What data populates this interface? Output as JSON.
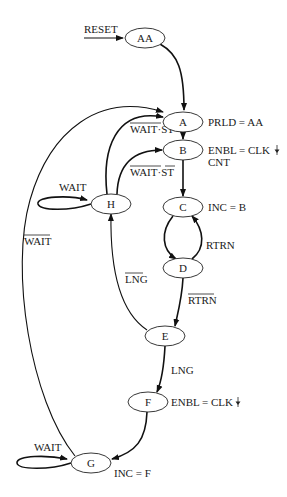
{
  "diagram": {
    "type": "state-machine",
    "states": {
      "AA": {
        "label": "AA"
      },
      "A": {
        "label": "A",
        "output": "PRLD = AA"
      },
      "B": {
        "label": "B",
        "output_line1": "ENBL = CLK",
        "output_line2": "CNT"
      },
      "C": {
        "label": "C",
        "output": "INC = B"
      },
      "D": {
        "label": "D"
      },
      "E": {
        "label": "E"
      },
      "F": {
        "label": "F",
        "output": "ENBL = CLK"
      },
      "G": {
        "label": "G",
        "output": "INC = F"
      },
      "H": {
        "label": "H"
      }
    },
    "edge_labels": {
      "reset": "RESET",
      "h_to_a": "WAIT·ST",
      "h_to_b": "WAIT·ST",
      "h_self": "WAIT",
      "g_to_a": "WAIT",
      "c_d_loop": "RTRN",
      "d_to_e": "RTRN",
      "e_to_h": "LNG",
      "e_to_f": "LNG",
      "g_self": "WAIT"
    },
    "transitions": [
      {
        "from": "RESET",
        "to": "AA",
        "condition": "RESET"
      },
      {
        "from": "AA",
        "to": "A",
        "condition": ""
      },
      {
        "from": "A",
        "to": "B",
        "condition": ""
      },
      {
        "from": "B",
        "to": "C",
        "condition": ""
      },
      {
        "from": "C",
        "to": "D",
        "condition": ""
      },
      {
        "from": "D",
        "to": "C",
        "condition": "RTRN"
      },
      {
        "from": "D",
        "to": "E",
        "condition": "NOT RTRN"
      },
      {
        "from": "E",
        "to": "H",
        "condition": "NOT LNG"
      },
      {
        "from": "E",
        "to": "F",
        "condition": "LNG"
      },
      {
        "from": "H",
        "to": "H",
        "condition": "WAIT"
      },
      {
        "from": "H",
        "to": "A",
        "condition": "NOT WAIT · ST"
      },
      {
        "from": "H",
        "to": "B",
        "condition": "NOT WAIT · NOT ST"
      },
      {
        "from": "F",
        "to": "G",
        "condition": ""
      },
      {
        "from": "G",
        "to": "G",
        "condition": "WAIT"
      },
      {
        "from": "G",
        "to": "A",
        "condition": "NOT WAIT"
      }
    ]
  }
}
